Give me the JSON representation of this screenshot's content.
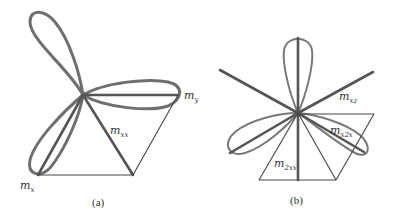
{
  "panels": [
    {
      "id": "a",
      "caption": "(a)",
      "labels": {
        "m_y": {
          "base": "m",
          "sub": "y"
        },
        "m_xx": {
          "base": "m",
          "sub": "xx"
        },
        "m_x": {
          "base": "m",
          "sub": "x"
        }
      }
    },
    {
      "id": "b",
      "caption": "(b)",
      "labels": {
        "m_xz": {
          "base": "m",
          "sub": "xz"
        },
        "m_x2x": {
          "base": "m",
          "sub": "x2x"
        },
        "m_2xx": {
          "base": "m",
          "sub": "2xx"
        }
      }
    }
  ]
}
